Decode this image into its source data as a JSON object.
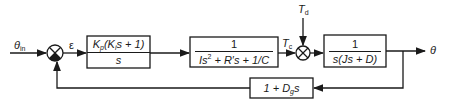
{
  "diagram": {
    "type": "control-system-block-diagram",
    "signals": {
      "input": {
        "symbol": "θ",
        "subscript": "in"
      },
      "error": {
        "symbol": "ε"
      },
      "control_torque": {
        "symbol": "T",
        "subscript": "c"
      },
      "disturbance": {
        "symbol": "T",
        "subscript": "d"
      },
      "output": {
        "symbol": "θ"
      }
    },
    "blocks": [
      {
        "id": "controller",
        "numerator": {
          "pre": "K",
          "pre_sub": "p",
          "mid": "(K",
          "mid_sub": "i",
          "post": "s + 1)"
        },
        "denominator": "s"
      },
      {
        "id": "actuator",
        "numerator": "1",
        "denominator": {
          "a": "Is",
          "a_sup": "2",
          "b": " + R′s + 1/C"
        }
      },
      {
        "id": "plant",
        "numerator": "1",
        "denominator": "s(Js + D)"
      },
      {
        "id": "feedback",
        "expr": {
          "pre": "1 + D",
          "sub": "g",
          "post": "s"
        }
      }
    ],
    "junctions": [
      {
        "id": "sum1",
        "inputs": [
          "θin (+)",
          "feedback (−)"
        ],
        "output": "ε"
      },
      {
        "id": "sum2",
        "inputs": [
          "Tc (+)",
          "Td (+)"
        ],
        "output": "plant input"
      }
    ],
    "colors": {
      "line": "#1a1a1a",
      "background": "#ffffff"
    }
  }
}
